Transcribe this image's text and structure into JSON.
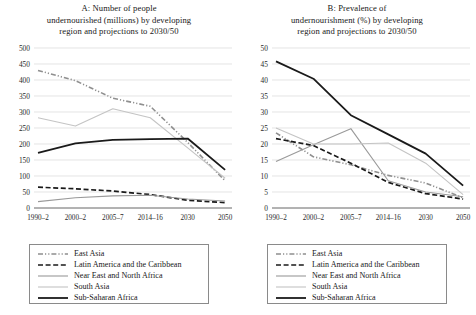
{
  "figure": {
    "panel_count": 2
  },
  "panelA": {
    "title_line1": "A: Number of people",
    "title_line2": "undernourished (millions) by developing",
    "title_line3": "region and projections to 2030/50"
  },
  "panelB": {
    "title_line1": "B: Prevalence of",
    "title_line2": "undernourishment (%) by developing",
    "title_line3": "region and projections to 2030/50"
  },
  "legend": {
    "items": [
      {
        "label": "East Asia",
        "style": "dash-dot-dot",
        "color": "#8f8f8f",
        "width": 1.6
      },
      {
        "label": "Latin America and the Caribbean",
        "style": "dashed",
        "color": "#1a1a1a",
        "width": 1.7
      },
      {
        "label": "Near East and North Africa",
        "style": "solid",
        "color": "#9a9a9a",
        "width": 1.1
      },
      {
        "label": "South Asia",
        "style": "solid",
        "color": "#c4c4c4",
        "width": 1.1
      },
      {
        "label": "Sub-Saharan Africa",
        "style": "solid",
        "color": "#1a1a1a",
        "width": 1.8
      }
    ]
  },
  "chart_data": [
    {
      "type": "line",
      "panel": "A",
      "title": "A: Number of people undernourished (millions) by developing region and projections to 2030/50",
      "xlabel": "",
      "ylabel": "",
      "categories": [
        "1990–2",
        "2000–2",
        "2005–7",
        "2014–16",
        "2030",
        "2050"
      ],
      "ylim": [
        0,
        500
      ],
      "ytick_step": 50,
      "yticks": [
        0,
        50,
        100,
        150,
        200,
        250,
        300,
        350,
        400,
        450,
        500
      ],
      "grid": true,
      "legend_position": "below",
      "series": [
        {
          "name": "East Asia",
          "values": [
            430,
            398,
            343,
            318,
            205,
            85
          ]
        },
        {
          "name": "Latin America and the Caribbean",
          "values": [
            65,
            60,
            53,
            42,
            24,
            17
          ]
        },
        {
          "name": "Near East and North Africa",
          "values": [
            20,
            32,
            38,
            40,
            28,
            22
          ]
        },
        {
          "name": "South Asia",
          "values": [
            282,
            256,
            310,
            282,
            188,
            93
          ]
        },
        {
          "name": "Sub-Saharan Africa",
          "values": [
            172,
            202,
            213,
            215,
            217,
            119
          ]
        }
      ]
    },
    {
      "type": "line",
      "panel": "B",
      "title": "B: Prevalence of undernourishment (%) by developing region and projections to 2030/50",
      "xlabel": "",
      "ylabel": "",
      "categories": [
        "1990–2",
        "2000–2",
        "2005–7",
        "2014–16",
        "2030",
        "2050"
      ],
      "ylim": [
        0,
        50
      ],
      "ytick_step": 5,
      "yticks": [
        0,
        5,
        10,
        15,
        20,
        25,
        30,
        35,
        40,
        45,
        50
      ],
      "grid": true,
      "legend_position": "below",
      "series": [
        {
          "name": "East Asia",
          "values": [
            23.5,
            16.0,
            13.5,
            10.2,
            7.8,
            3.2
          ]
        },
        {
          "name": "Latin America and the Caribbean",
          "values": [
            21.7,
            19.5,
            14.0,
            8.0,
            4.5,
            2.8
          ]
        },
        {
          "name": "Near East and North Africa",
          "values": [
            14.5,
            19.8,
            24.8,
            8.5,
            5.0,
            3.5
          ]
        },
        {
          "name": "South Asia",
          "values": [
            25.0,
            20.0,
            20.0,
            20.3,
            14.0,
            4.2
          ]
        },
        {
          "name": "Sub-Saharan Africa",
          "values": [
            45.8,
            40.4,
            29.0,
            23.0,
            17.0,
            7.0
          ]
        }
      ]
    }
  ],
  "colors": {
    "grid": "#d9d9d9",
    "axis": "#555555",
    "text": "#181818",
    "background": "#ffffff"
  }
}
